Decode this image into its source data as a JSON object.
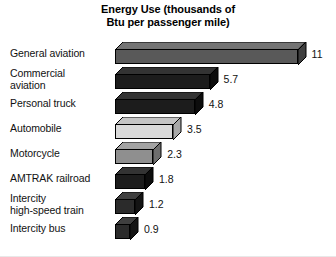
{
  "chart_data": {
    "type": "bar",
    "orientation": "horizontal",
    "style": "3d-isometric",
    "title": "Energy Use (thousands of Btu per passenger mile)",
    "title_lines": [
      "Energy Use (thousands of",
      "Btu per passenger mile)"
    ],
    "xlabel": "",
    "ylabel": "",
    "xlim": [
      0,
      11
    ],
    "grid": false,
    "legend": "none",
    "categories": [
      "General aviation",
      "Commercial aviation",
      "Personal truck",
      "Automobile",
      "Motorcycle",
      "AMTRAK railroad",
      "Intercity high-speed train",
      "Intercity bus"
    ],
    "values": [
      11,
      5.7,
      4.8,
      3.5,
      2.3,
      1.8,
      1.2,
      0.9
    ],
    "units": "thousands of Btu per passenger mile",
    "bars": [
      {
        "category": "General aviation",
        "label_lines": [
          "General aviation"
        ],
        "value": 11,
        "value_label": "11",
        "face_color": "#595959",
        "top_color": "#747474",
        "side_color": "#3f3f3f"
      },
      {
        "category": "Commercial aviation",
        "label_lines": [
          "Commercial",
          "aviation"
        ],
        "value": 5.7,
        "value_label": "5.7",
        "face_color": "#1c1c1c",
        "top_color": "#333333",
        "side_color": "#0d0d0d"
      },
      {
        "category": "Personal truck",
        "label_lines": [
          "Personal truck"
        ],
        "value": 4.8,
        "value_label": "4.8",
        "face_color": "#1c1c1c",
        "top_color": "#333333",
        "side_color": "#0d0d0d"
      },
      {
        "category": "Automobile",
        "label_lines": [
          "Automobile"
        ],
        "value": 3.5,
        "value_label": "3.5",
        "face_color": "#d9d9d9",
        "top_color": "#c4c4c4",
        "side_color": "#a8a8a8"
      },
      {
        "category": "Motorcycle",
        "label_lines": [
          "Motorcycle"
        ],
        "value": 2.3,
        "value_label": "2.3",
        "face_color": "#8f8f8f",
        "top_color": "#a3a3a3",
        "side_color": "#6e6e6e"
      },
      {
        "category": "AMTRAK railroad",
        "label_lines": [
          "AMTRAK railroad"
        ],
        "value": 1.8,
        "value_label": "1.8",
        "face_color": "#1c1c1c",
        "top_color": "#333333",
        "side_color": "#0d0d0d"
      },
      {
        "category": "Intercity high-speed train",
        "label_lines": [
          "Intercity",
          "high-speed train"
        ],
        "value": 1.2,
        "value_label": "1.2",
        "face_color": "#2b2b2b",
        "top_color": "#3f3f3f",
        "side_color": "#141414"
      },
      {
        "category": "Intercity bus",
        "label_lines": [
          "Intercity bus"
        ],
        "value": 0.9,
        "value_label": "0.9",
        "face_color": "#2b2b2b",
        "top_color": "#3f3f3f",
        "side_color": "#141414"
      }
    ]
  },
  "layout": {
    "bar_origin_x": 115,
    "px_per_unit": 16.6,
    "row_height": 25,
    "depth": 8
  }
}
